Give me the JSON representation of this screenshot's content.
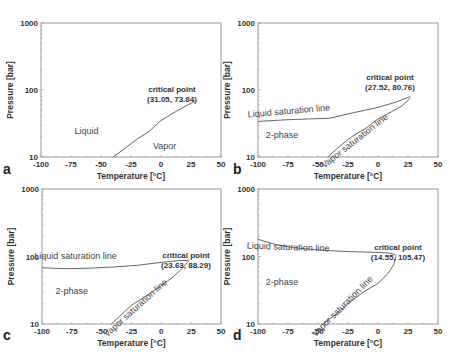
{
  "chart_data": [
    {
      "type": "line",
      "panel": "a",
      "xlabel": "Temperature [°C]",
      "ylabel": "Pressure [bar]",
      "xlim": [
        -100,
        50
      ],
      "ylim": [
        10,
        1000
      ],
      "yscale": "log",
      "x_ticks": [
        "-100",
        "-75",
        "-50",
        "-25",
        "0",
        "25",
        "50"
      ],
      "y_ticks": [
        "10",
        "100",
        "1000"
      ],
      "critical_point": {
        "label": "critical point",
        "value": "(31.05, 73.84)"
      },
      "annotations": [
        {
          "text": "Liquid",
          "x": -62,
          "y": 22
        },
        {
          "text": "Vapor",
          "x": 3,
          "y": 13
        }
      ],
      "series": [
        {
          "name": "saturation curve",
          "points": [
            [
              -40,
              10
            ],
            [
              -30,
              13.5
            ],
            [
              -20,
              18.5
            ],
            [
              -10,
              24
            ],
            [
              0,
              35
            ],
            [
              10,
              45
            ],
            [
              20,
              57
            ],
            [
              28,
              68
            ]
          ]
        }
      ]
    },
    {
      "type": "line",
      "panel": "b",
      "xlabel": "Temperature [°C]",
      "ylabel": "Pressure [bar]",
      "xlim": [
        -100,
        50
      ],
      "ylim": [
        10,
        1000
      ],
      "yscale": "log",
      "x_ticks": [
        "-100",
        "-75",
        "-50",
        "-25",
        "0",
        "25",
        "50"
      ],
      "y_ticks": [
        "10",
        "100",
        "1000"
      ],
      "critical_point": {
        "label": "critical point",
        "value": "(27.52, 80.76)"
      },
      "annotations": [
        {
          "text": "2-phase",
          "x": -80,
          "y": 19
        },
        {
          "text": "Liquid saturation line",
          "x": -74,
          "y": 44,
          "rotate": -5
        },
        {
          "text": "Vapor saturation line",
          "x": -18,
          "y": 16,
          "rotate": -38
        }
      ],
      "series": [
        {
          "name": "Liquid saturation line",
          "points": [
            [
              -100,
              34
            ],
            [
              -75,
              36
            ],
            [
              -40,
              38
            ],
            [
              -25,
              44
            ],
            [
              0,
              55
            ],
            [
              15,
              66
            ],
            [
              27,
              80
            ]
          ]
        },
        {
          "name": "Vapor saturation line",
          "points": [
            [
              -42,
              10
            ],
            [
              -35,
              13
            ],
            [
              -22,
              20
            ],
            [
              -10,
              27
            ],
            [
              0,
              37
            ],
            [
              10,
              46
            ],
            [
              20,
              58
            ],
            [
              27,
              76
            ]
          ]
        }
      ]
    },
    {
      "type": "line",
      "panel": "c",
      "xlabel": "Temperature [°C]",
      "ylabel": "Pressure [bar]",
      "xlim": [
        -100,
        50
      ],
      "ylim": [
        10,
        1000
      ],
      "yscale": "log",
      "x_ticks": [
        "-100",
        "-75",
        "-50",
        "-25",
        "0",
        "25",
        "50"
      ],
      "y_ticks": [
        "10",
        "100",
        "1000"
      ],
      "critical_point": {
        "label": "critical point",
        "value": "(23.63, 88.29)"
      },
      "annotations": [
        {
          "text": "2-phase",
          "x": -75,
          "y": 28
        },
        {
          "text": "Liquid saturation line",
          "x": -72,
          "y": 92
        },
        {
          "text": "Vapor saturation line",
          "x": -20,
          "y": 16,
          "rotate": -42
        }
      ],
      "series": [
        {
          "name": "Liquid saturation line",
          "points": [
            [
              -100,
              68
            ],
            [
              -80,
              66
            ],
            [
              -60,
              67
            ],
            [
              -40,
              70
            ],
            [
              -20,
              74
            ],
            [
              0,
              82
            ],
            [
              15,
              87
            ],
            [
              23,
              88
            ]
          ]
        },
        {
          "name": "Vapor saturation line",
          "points": [
            [
              -42,
              10
            ],
            [
              -35,
              13
            ],
            [
              -25,
              19
            ],
            [
              -10,
              28
            ],
            [
              0,
              37
            ],
            [
              10,
              50
            ],
            [
              18,
              68
            ],
            [
              23,
              86
            ]
          ]
        }
      ]
    },
    {
      "type": "line",
      "panel": "d",
      "xlabel": "Temperature [°C]",
      "ylabel": "Pressure [bar]",
      "xlim": [
        -100,
        50
      ],
      "ylim": [
        10,
        1000
      ],
      "yscale": "log",
      "x_ticks": [
        "-100",
        "-75",
        "-50",
        "-25",
        "0",
        "25",
        "50"
      ],
      "y_ticks": [
        "10",
        "100",
        "1000"
      ],
      "critical_point": {
        "label": "critical point",
        "value": "(14.55, 105.47)"
      },
      "annotations": [
        {
          "text": "2-phase",
          "x": -80,
          "y": 38
        },
        {
          "text": "Liquid saturation line",
          "x": -75,
          "y": 125,
          "rotate": 2
        },
        {
          "text": "Vapor saturation line",
          "x": -28,
          "y": 17,
          "rotate": -45
        }
      ],
      "series": [
        {
          "name": "Liquid saturation line",
          "points": [
            [
              -100,
              180
            ],
            [
              -85,
              150
            ],
            [
              -70,
              135
            ],
            [
              -50,
              125
            ],
            [
              -25,
              118
            ],
            [
              0,
              115
            ],
            [
              10,
              112
            ],
            [
              15,
              105
            ]
          ]
        },
        {
          "name": "Vapor saturation line",
          "points": [
            [
              -46,
              10
            ],
            [
              -35,
              14
            ],
            [
              -25,
              20
            ],
            [
              -12,
              30
            ],
            [
              0,
              40
            ],
            [
              8,
              55
            ],
            [
              13,
              75
            ],
            [
              15,
              100
            ]
          ]
        }
      ]
    }
  ],
  "panels": [
    {
      "letter": "a"
    },
    {
      "letter": "b"
    },
    {
      "letter": "c"
    },
    {
      "letter": "d"
    }
  ]
}
